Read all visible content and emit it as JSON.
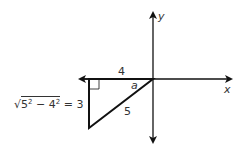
{
  "diagram": {
    "axes": {
      "x_label": "x",
      "y_label": "y",
      "origin_px": [
        153,
        79
      ]
    },
    "triangle": {
      "vertices_px": [
        [
          153,
          79
        ],
        [
          89,
          79
        ],
        [
          89,
          128
        ]
      ],
      "horizontal_leg_label": "4",
      "hypotenuse_label": "5",
      "angle_label": "a",
      "right_angle_marker": true,
      "vertical_leg_equation": {
        "radical_sign": "√",
        "radicand_a": "5",
        "exp_a": "2",
        "minus": " − ",
        "radicand_b": "4",
        "exp_b": "2",
        "result": " = 3"
      }
    },
    "colors": {
      "line": "#111111",
      "text": "#333333",
      "background": "#ffffff"
    }
  }
}
